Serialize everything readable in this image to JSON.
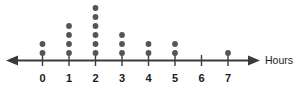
{
  "chart_data": {
    "type": "dot-plot",
    "title": "",
    "subtitle": "",
    "xlabel": "Hours",
    "ylabel": "",
    "categories": [
      "0",
      "1",
      "2",
      "3",
      "4",
      "5",
      "6",
      "7"
    ],
    "values": [
      2,
      4,
      6,
      3,
      2,
      2,
      0,
      1
    ],
    "x": [
      0,
      1,
      2,
      3,
      4,
      5,
      6,
      7
    ],
    "tick_labels": [
      "0",
      "1",
      "2",
      "3",
      "4",
      "5",
      "6",
      "7"
    ],
    "xlim": [
      0,
      7
    ],
    "ylim": [
      0,
      6
    ],
    "grid": false,
    "legend": null,
    "total_dots": 20,
    "dot_color": "#555555",
    "axis_color": "#3a3a3a",
    "axis_has_left_arrow": true,
    "axis_has_right_arrow": true,
    "annotations": []
  },
  "axis": {
    "title": "Hours"
  },
  "columns": [
    {
      "label": "0",
      "count": 2
    },
    {
      "label": "1",
      "count": 4
    },
    {
      "label": "2",
      "count": 6
    },
    {
      "label": "3",
      "count": 3
    },
    {
      "label": "4",
      "count": 2
    },
    {
      "label": "5",
      "count": 2
    },
    {
      "label": "6",
      "count": 0
    },
    {
      "label": "7",
      "count": 1
    }
  ]
}
